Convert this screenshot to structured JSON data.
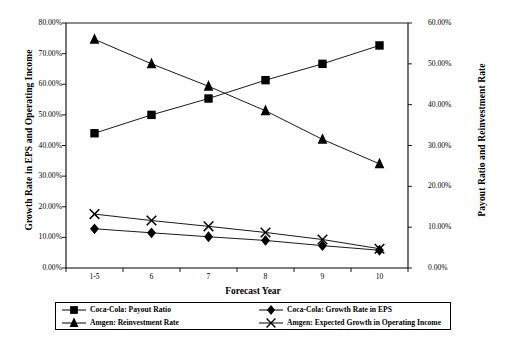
{
  "chart_data": {
    "type": "line",
    "title": "",
    "xlabel": "Forecast Year",
    "ylabel": "Growth Rate in EPS and Operating Income",
    "y2label": "Payout Ratio and Reinvestment Rate",
    "categories": [
      "1-5",
      "6",
      "7",
      "8",
      "9",
      "10"
    ],
    "ylim": [
      0,
      80
    ],
    "y2lim": [
      0,
      60
    ],
    "grid": false,
    "legend_position": "bottom",
    "yticks": [
      "0.00%",
      "10.00%",
      "20.00%",
      "30.00%",
      "40.00%",
      "50.00%",
      "60.00%",
      "70.00%",
      "80.00%"
    ],
    "ytick_values": [
      0,
      10,
      20,
      30,
      40,
      50,
      60,
      70,
      80
    ],
    "y2ticks": [
      "0.00%",
      "10.00%",
      "20.00%",
      "30.00%",
      "40.00%",
      "50.00%",
      "60.00%"
    ],
    "y2tick_values": [
      0,
      10,
      20,
      30,
      40,
      50,
      60
    ],
    "series": [
      {
        "name": "Coca-Cola: Payout Ratio",
        "marker": "square",
        "axis": "right",
        "values": [
          33.0,
          37.5,
          41.5,
          46.0,
          50.0,
          54.5
        ]
      },
      {
        "name": "Amgen: Reinvestment Rate",
        "marker": "triangle",
        "axis": "right",
        "values": [
          56.0,
          50.0,
          44.5,
          38.5,
          31.5,
          25.5
        ]
      },
      {
        "name": "Coca-Cola: Growth Rate in EPS",
        "marker": "diamond",
        "axis": "left",
        "values": [
          12.8,
          11.5,
          10.2,
          9.0,
          7.3,
          5.8
        ]
      },
      {
        "name": "Amgen: Expected Growth in Operating Income",
        "marker": "cross",
        "axis": "left",
        "values": [
          17.6,
          15.5,
          13.6,
          11.6,
          9.3,
          6.3
        ]
      }
    ]
  },
  "legend": {
    "items": [
      {
        "label": "Coca-Cola: Payout Ratio",
        "marker": "square"
      },
      {
        "label": "Coca-Cola: Growth Rate in EPS",
        "marker": "diamond"
      },
      {
        "label": "Amgen: Reinvestment Rate",
        "marker": "triangle"
      },
      {
        "label": "Amgen: Expected Growth in Operating Income",
        "marker": "cross"
      }
    ]
  },
  "colors": {
    "series": "#000000",
    "axis": "#000000",
    "background": "#ffffff"
  }
}
